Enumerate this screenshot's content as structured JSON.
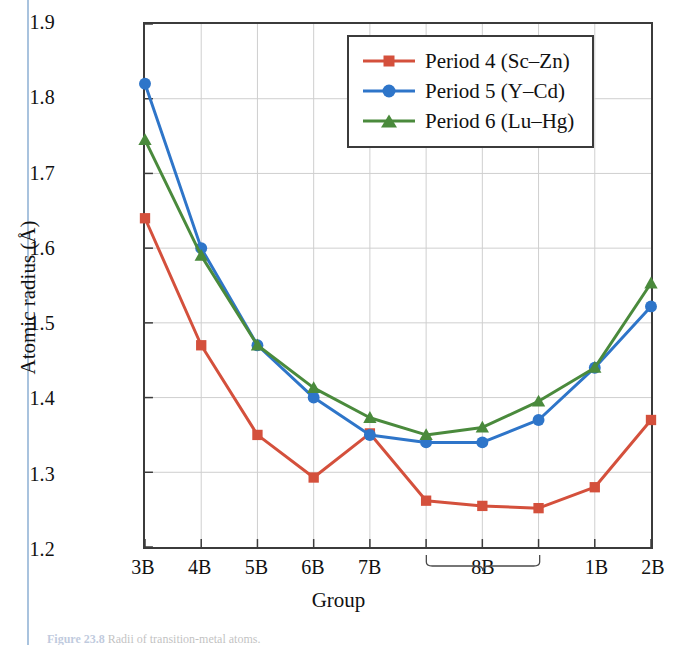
{
  "figure": {
    "caption_label": "Figure 23.8",
    "caption_text": "Radii of transition-metal atoms."
  },
  "chart_data": {
    "type": "line",
    "title": "",
    "xlabel": "Group",
    "ylabel": "Atomic radius (Å)",
    "ylim": [
      1.2,
      1.9
    ],
    "ytick_labels": [
      "1.2",
      "1.3",
      "1.4",
      "1.5",
      "1.6",
      "1.7",
      "1.8",
      "1.9"
    ],
    "ytick_values": [
      1.2,
      1.3,
      1.4,
      1.5,
      1.6,
      1.7,
      1.8,
      1.9
    ],
    "grid": true,
    "legend_position": "top-right",
    "x_positions": [
      0,
      1,
      2,
      3,
      4,
      5,
      6,
      7,
      8,
      9
    ],
    "categories": [
      "3B",
      "4B",
      "5B",
      "6B",
      "7B",
      "",
      "",
      "",
      "1B",
      "2B"
    ],
    "xtick_labels": [
      {
        "label": "3B",
        "index": 0
      },
      {
        "label": "4B",
        "index": 1
      },
      {
        "label": "5B",
        "index": 2
      },
      {
        "label": "6B",
        "index": 3
      },
      {
        "label": "7B",
        "index": 4
      },
      {
        "label": "1B",
        "index": 8
      },
      {
        "label": "2B",
        "index": 9
      }
    ],
    "bracket": {
      "label": "8B",
      "start_index": 5,
      "end_index": 7
    },
    "series": [
      {
        "name": "Period 4 (Sc–Zn)",
        "color": "#d4503c",
        "marker": "square",
        "values": [
          1.64,
          1.47,
          1.35,
          1.293,
          1.352,
          1.262,
          1.255,
          1.252,
          1.28,
          1.37
        ]
      },
      {
        "name": "Period 5 (Y–Cd)",
        "color": "#2e75c9",
        "marker": "circle",
        "values": [
          1.82,
          1.6,
          1.47,
          1.4,
          1.35,
          1.34,
          1.34,
          1.37,
          1.44,
          1.522
        ]
      },
      {
        "name": "Period 6 (Lu–Hg)",
        "color": "#4a8a3c",
        "marker": "triangle",
        "values": [
          1.745,
          1.59,
          1.47,
          1.413,
          1.373,
          1.35,
          1.36,
          1.395,
          1.44,
          1.553
        ]
      }
    ]
  }
}
